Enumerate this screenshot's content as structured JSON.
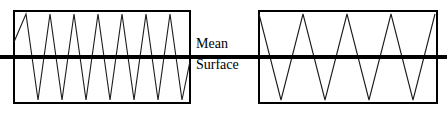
{
  "figure": {
    "title_label_line1": "Mean",
    "title_label_line2": "Surface",
    "colors": {
      "box_stroke": "#000000",
      "wave_stroke": "#1a1a1a",
      "mean_line": "#000000",
      "background": "#ffffff",
      "text": "#000000"
    }
  },
  "chart_data": {
    "type": "line",
    "title": "",
    "subtitle": "",
    "xlabel": "",
    "ylabel": "",
    "annotations": [
      "Mean",
      "Surface"
    ],
    "legend": [],
    "grid": false,
    "mean_line": {
      "label": "Mean Surface",
      "y": 0,
      "x_start": 0,
      "x_end": 447,
      "thickness_px": 4
    },
    "panels": [
      {
        "name": "left-profile",
        "box": {
          "x": 14,
          "y": 11,
          "width": 176,
          "height": 92
        },
        "peak_count": 7,
        "valley_count": 7,
        "wavelength_px": 24,
        "amplitude": 1.0,
        "ylim": [
          -1,
          1
        ],
        "series": [
          {
            "name": "high-frequency-profile",
            "points_x": [
              14,
              26,
              38,
              50,
              62,
              74,
              86,
              98,
              110,
              122,
              134,
              146,
              158,
              170,
              182,
              190
            ],
            "points_y": [
              0.35,
              1,
              -1,
              1,
              -1,
              1,
              -1,
              1,
              -1,
              1,
              -1,
              1,
              -1,
              1,
              -1,
              -0.1
            ]
          }
        ]
      },
      {
        "name": "right-profile",
        "box": {
          "x": 259,
          "y": 11,
          "width": 178,
          "height": 92
        },
        "peak_count": 4,
        "valley_count": 4,
        "wavelength_px": 44,
        "amplitude": 1.0,
        "ylim": [
          -1,
          1
        ],
        "series": [
          {
            "name": "low-frequency-profile",
            "points_x": [
              259,
              281,
              303,
              325,
              347,
              369,
              391,
              413,
              435
            ],
            "points_y": [
              1,
              -1,
              1,
              -1,
              1,
              -1,
              1,
              -1,
              1
            ]
          }
        ]
      }
    ]
  }
}
